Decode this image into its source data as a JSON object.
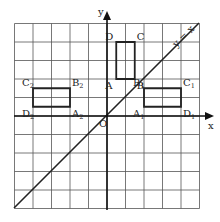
{
  "diagram": {
    "type": "coordinate-grid",
    "grid": {
      "x_min": -5,
      "x_max": 5,
      "y_min": -5,
      "y_max": 5,
      "cell": 1
    },
    "axes": {
      "x_label": "x",
      "y_label": "y",
      "origin_label": "O"
    },
    "line": {
      "label": "y = x",
      "slope": 1
    },
    "rectangles": [
      {
        "name": "ABCD",
        "points": [
          {
            "label": "A",
            "sub": "",
            "x": 0.5,
            "y": 2
          },
          {
            "label": "B",
            "sub": "",
            "x": 1.5,
            "y": 2
          },
          {
            "label": "C",
            "sub": "",
            "x": 1.5,
            "y": 4
          },
          {
            "label": "D",
            "sub": "",
            "x": 0.5,
            "y": 4
          }
        ]
      },
      {
        "name": "A1B1C1D1",
        "points": [
          {
            "label": "A",
            "sub": "1",
            "x": 2,
            "y": 0.5
          },
          {
            "label": "B",
            "sub": "1",
            "x": 2,
            "y": 1.5
          },
          {
            "label": "C",
            "sub": "1",
            "x": 4,
            "y": 1.5
          },
          {
            "label": "D",
            "sub": "1",
            "x": 4,
            "y": 0.5
          }
        ]
      },
      {
        "name": "A2B2C2D2",
        "points": [
          {
            "label": "A",
            "sub": "2",
            "x": -2,
            "y": 0.5
          },
          {
            "label": "B",
            "sub": "2",
            "x": -2,
            "y": 1.5
          },
          {
            "label": "C",
            "sub": "2",
            "x": -4,
            "y": 1.5
          },
          {
            "label": "D",
            "sub": "2",
            "x": -4,
            "y": 0.5
          }
        ]
      }
    ]
  }
}
